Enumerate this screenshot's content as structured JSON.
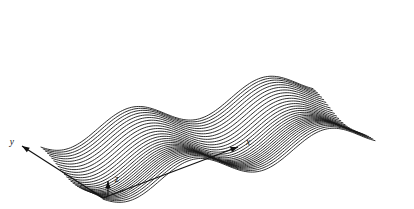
{
  "figure": {
    "kind": "wireframe-surface-plot",
    "background_color": "#ffffff",
    "line_color": "#1a1a1a",
    "axis_color": "#111111",
    "axes": {
      "x": {
        "label": "x",
        "arrow": "arrow-right-up"
      },
      "y": {
        "label": "y",
        "arrow": "arrow-left-up"
      },
      "z": {
        "label": "z",
        "arrow": "arrow-up"
      }
    }
  },
  "chart_data": {
    "type": "line",
    "title": "",
    "subtitle": "",
    "xlabel": "x",
    "ylabel": "y",
    "zlabel": "z",
    "grid": false,
    "legend": false,
    "legend_position": "none",
    "projection": "oblique-3d",
    "surface_function": "z = a1*sin(2*pi*fx*x + p1) + a2*sin(2*pi*fy*y + p2)",
    "n_curves": 30,
    "points_per_curve": 121,
    "xlim": [
      0,
      1
    ],
    "ylim": [
      0,
      1
    ],
    "zlim": [
      -1,
      1
    ],
    "wave": {
      "x_cycles": 2.05,
      "x_phase_deg": 205,
      "x_amplitude": 1.0,
      "y_cycles": 1.0,
      "y_phase_deg": 95,
      "y_amplitude": 0.34
    },
    "projection_params": {
      "origin_px": [
        103,
        198
      ],
      "x_axis_vector_px": [
        272,
        -62
      ],
      "y_axis_vector_px": [
        -62,
        -52
      ],
      "z_axis_scale_px": 13.5
    },
    "axis_arrows": [
      {
        "name": "x",
        "label": "x",
        "tail_px": [
          103,
          198
        ],
        "tip_px": [
          238,
          147
        ],
        "label_px": [
          246,
          143
        ]
      },
      {
        "name": "y",
        "label": "y",
        "tail_px": [
          103,
          198
        ],
        "tip_px": [
          22,
          146
        ],
        "label_px": [
          14,
          143
        ]
      },
      {
        "name": "z",
        "label": "z",
        "tail_px": [
          108,
          196
        ],
        "tip_px": [
          108,
          181
        ],
        "label_px": [
          115,
          180
        ]
      }
    ],
    "values_note": "Relative surface height z sampled on a 0-1 unit square; curves are iso-y slices",
    "z_rows": [
      {
        "y": 0.0,
        "z_min": -1.34,
        "z_max": 1.34
      },
      {
        "y": 0.5,
        "z_min": -1.0,
        "z_max": 1.0
      },
      {
        "y": 1.0,
        "z_min": -1.34,
        "z_max": 1.34
      }
    ]
  }
}
